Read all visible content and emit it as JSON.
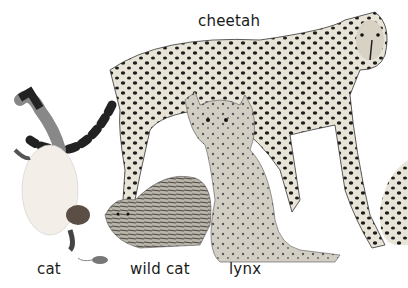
{
  "illustration": {
    "subject": "members of the cat family",
    "labels": {
      "cheetah": "cheetah",
      "cat": "cat",
      "wild_cat": "wild cat",
      "lynx": "lynx"
    }
  }
}
